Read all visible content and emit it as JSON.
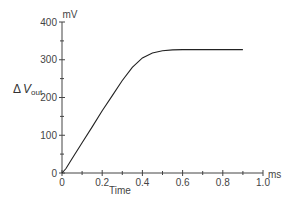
{
  "chart_data": {
    "type": "line",
    "title": "",
    "xlabel": "Time",
    "xunit": "ms",
    "ylabel": "ΔV_out",
    "ylabel_main": "Δ",
    "ylabel_var": "V",
    "ylabel_sub": "out",
    "yunit": "mV",
    "xlim": [
      0,
      1.0
    ],
    "ylim": [
      0,
      400
    ],
    "grid": false,
    "x_ticks": [
      "0",
      "0.2",
      "0.4",
      "0.6",
      "0.8",
      "1.0"
    ],
    "y_ticks": [
      "0",
      "100",
      "200",
      "300",
      "400"
    ],
    "series": [
      {
        "name": "ΔV_out",
        "x": [
          0,
          0.02,
          0.05,
          0.1,
          0.15,
          0.2,
          0.25,
          0.3,
          0.35,
          0.4,
          0.45,
          0.5,
          0.55,
          0.6,
          0.65,
          0.7,
          0.75,
          0.8,
          0.85,
          0.9
        ],
        "y": [
          0,
          12,
          38,
          80,
          122,
          165,
          205,
          245,
          280,
          305,
          318,
          324,
          326,
          327,
          327,
          327,
          327,
          327,
          327,
          327
        ]
      }
    ]
  },
  "labels": {
    "yunit": "mV",
    "xunit": "ms",
    "xlabel": "Time",
    "ylabel_delta": "Δ",
    "ylabel_var": "V",
    "ylabel_sub": "out",
    "xticks": [
      "0",
      "0.2",
      "0.4",
      "0.6",
      "0.8",
      "1.0"
    ],
    "yticks": [
      "0",
      "100",
      "200",
      "300",
      "400"
    ]
  }
}
